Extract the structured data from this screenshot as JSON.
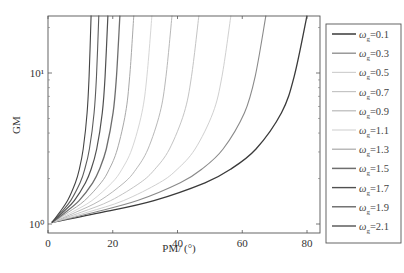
{
  "chart_data": {
    "type": "line",
    "title": "",
    "xlabel": "PM/ (°)",
    "ylabel": "GM",
    "xlim": [
      0,
      84
    ],
    "ylim_log10": [
      0,
      1.38
    ],
    "yscale": "log",
    "x_ticks": [
      0,
      20,
      40,
      60,
      80
    ],
    "x_tick_labels": [
      "0",
      "20",
      "40",
      "60",
      "80"
    ],
    "y_ticks": [
      1,
      10
    ],
    "y_tick_labels": [
      "10⁰",
      "10¹"
    ],
    "grid": false,
    "legend_position": "outside-right",
    "curve_start_pm": 1.2,
    "shape_fractions": [
      0,
      0.2,
      0.4,
      0.6,
      0.7,
      0.8,
      0.9,
      0.95,
      1.0
    ],
    "shape_log10_gm": [
      0.01,
      0.078,
      0.155,
      0.273,
      0.362,
      0.497,
      0.737,
      0.978,
      1.38
    ],
    "series": [
      {
        "name": "ωg=0.1",
        "omega": "0.1",
        "pm_exit_top": 80.0,
        "color": "#3a3a3a",
        "width": 1.3
      },
      {
        "name": "ωg=0.3",
        "omega": "0.3",
        "pm_exit_top": 67.3,
        "color": "#8a8a8a",
        "width": 1.1
      },
      {
        "name": "ωg=0.5",
        "omega": "0.5",
        "pm_exit_top": 56.5,
        "color": "#d0d0d0",
        "width": 1.0
      },
      {
        "name": "ωg=0.7",
        "omega": "0.7",
        "pm_exit_top": 46.6,
        "color": "#c4c4c4",
        "width": 1.0
      },
      {
        "name": "ωg=0.9",
        "omega": "0.9",
        "pm_exit_top": 38.3,
        "color": "#b8b8b8",
        "width": 1.0
      },
      {
        "name": "ωg=1.1",
        "omega": "1.1",
        "pm_exit_top": 32.1,
        "color": "#d6d6d6",
        "width": 1.0
      },
      {
        "name": "ωg=1.3",
        "omega": "1.3",
        "pm_exit_top": 26.5,
        "color": "#a8a8a8",
        "width": 1.0
      },
      {
        "name": "ωg=1.5",
        "omega": "1.5",
        "pm_exit_top": 22.2,
        "color": "#6e6e6e",
        "width": 1.3
      },
      {
        "name": "ωg=1.7",
        "omega": "1.7",
        "pm_exit_top": 18.5,
        "color": "#505050",
        "width": 1.2
      },
      {
        "name": "ωg=1.9",
        "omega": "1.9",
        "pm_exit_top": 15.7,
        "color": "#5c5c5c",
        "width": 1.1
      },
      {
        "name": "ωg=2.1",
        "omega": "2.1",
        "pm_exit_top": 13.3,
        "color": "#444444",
        "width": 1.1
      }
    ]
  },
  "legend": {
    "prefix": "ω",
    "subscript": "g",
    "items": [
      "=0.1",
      "=0.3",
      "=0.5",
      "=0.7",
      "=0.9",
      "=1.1",
      "=1.3",
      "=1.5",
      "=1.7",
      "=1.9",
      "=2.1"
    ]
  }
}
